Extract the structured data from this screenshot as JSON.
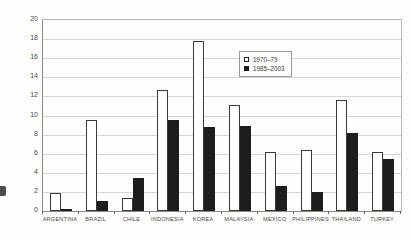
{
  "figure": {
    "background_color": "#fdfdfc",
    "gridline_color": "#d6d6d3",
    "axis_color": "#8a8a8a",
    "text_color": "#4a4a4a"
  },
  "chart_data": {
    "type": "bar",
    "title": "",
    "xlabel": "",
    "ylabel": "",
    "categories": [
      "ARGENTINA",
      "BRAZIL",
      "CHILE",
      "INDONESIA",
      "KOREA",
      "MALAYSIA",
      "MEXICO",
      "PHILIPPINES",
      "THAILAND",
      "TURKEY"
    ],
    "series": [
      {
        "name": "1970–79",
        "style": "open",
        "fill": "#ffffff",
        "border": "#3a3a3a",
        "values": [
          1.9,
          9.5,
          1.4,
          12.7,
          17.8,
          11.1,
          6.2,
          6.4,
          11.6,
          6.2
        ]
      },
      {
        "name": "1985–2003",
        "style": "filled",
        "fill": "#1d1d1d",
        "border": "#1d1d1d",
        "values": [
          0.2,
          1.0,
          3.5,
          9.5,
          8.8,
          8.9,
          2.6,
          2.0,
          8.2,
          5.4
        ]
      }
    ],
    "ylim": [
      0,
      20
    ],
    "yticks": [
      0,
      2,
      4,
      6,
      8,
      10,
      12,
      14,
      16,
      18,
      20
    ],
    "grid": true,
    "legend_position": "upper-middle-right"
  }
}
